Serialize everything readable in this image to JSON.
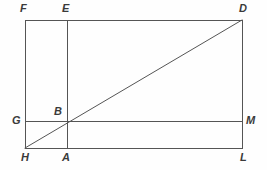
{
  "figure": {
    "type": "geometry-diagram",
    "background_color": "#fefefe",
    "stroke_color": "#555555",
    "label_color": "#3a3a3a",
    "stroke_width": 1,
    "points": [
      {
        "name": "F",
        "label": "F",
        "x": 25,
        "y": 20,
        "label_x": 20,
        "label_y": 3
      },
      {
        "name": "E",
        "label": "E",
        "x": 67,
        "y": 20,
        "label_x": 62,
        "label_y": 3
      },
      {
        "name": "D",
        "label": "D",
        "x": 242,
        "y": 20,
        "label_x": 239,
        "label_y": 3
      },
      {
        "name": "G",
        "label": "G",
        "x": 25,
        "y": 121,
        "label_x": 12,
        "label_y": 115
      },
      {
        "name": "B",
        "label": "B",
        "x": 67,
        "y": 121,
        "label_x": 54,
        "label_y": 106
      },
      {
        "name": "M",
        "label": "M",
        "x": 242,
        "y": 121,
        "label_x": 246,
        "label_y": 115
      },
      {
        "name": "H",
        "label": "H",
        "x": 25,
        "y": 148,
        "label_x": 21,
        "label_y": 152
      },
      {
        "name": "A",
        "label": "A",
        "x": 67,
        "y": 148,
        "label_x": 62,
        "label_y": 152
      },
      {
        "name": "L",
        "label": "L",
        "x": 242,
        "y": 148,
        "label_x": 240,
        "label_y": 152
      }
    ],
    "segments": [
      {
        "name": "top-edge-FD",
        "x1": 25,
        "y1": 20,
        "x2": 242,
        "y2": 20
      },
      {
        "name": "bottom-edge-HL",
        "x1": 25,
        "y1": 148,
        "x2": 242,
        "y2": 148
      },
      {
        "name": "left-edge-FH",
        "x1": 25,
        "y1": 20,
        "x2": 25,
        "y2": 148
      },
      {
        "name": "right-edge-DL",
        "x1": 242,
        "y1": 20,
        "x2": 242,
        "y2": 148
      },
      {
        "name": "horizontal-chord-GM",
        "x1": 25,
        "y1": 121,
        "x2": 242,
        "y2": 121
      },
      {
        "name": "vertical-chord-EA",
        "x1": 67,
        "y1": 20,
        "x2": 67,
        "y2": 148
      },
      {
        "name": "diagonal-HD",
        "x1": 25,
        "y1": 148,
        "x2": 242,
        "y2": 20
      }
    ]
  }
}
